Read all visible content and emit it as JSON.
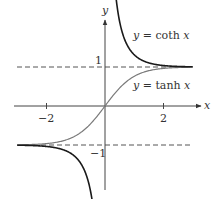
{
  "chart_data": {
    "type": "line",
    "title": "",
    "xlabel": "x",
    "ylabel": "y",
    "xlim": [
      -3.1,
      3.4
    ],
    "ylim": [
      -2.1,
      2.2
    ],
    "grid": false,
    "x_ticks": [
      {
        "value": -2,
        "label": "−2"
      },
      {
        "value": 2,
        "label": "2"
      }
    ],
    "y_ticks": [
      {
        "value": 1,
        "label": "1"
      },
      {
        "value": -1,
        "label": "−1"
      }
    ],
    "asymptotes": [
      {
        "y": 1,
        "style": "dashed"
      },
      {
        "y": -1,
        "style": "dashed"
      }
    ],
    "series": [
      {
        "name": "y = tanh x",
        "function": "tanh",
        "color": "#7a7a7a",
        "x_range": [
          -3.0,
          3.0
        ]
      },
      {
        "name": "y = coth x",
        "function": "coth",
        "color": "#1a1a1a",
        "branches": [
          [
            0.35,
            3.0
          ],
          [
            -3.0,
            -0.35
          ]
        ]
      }
    ],
    "annotations": [
      {
        "text": "y = coth x",
        "near": [
          1.1,
          1.85
        ]
      },
      {
        "text": "y = tanh x",
        "near": [
          1.1,
          0.4
        ]
      }
    ]
  },
  "labels": {
    "x_axis": "x",
    "y_axis": "y",
    "tick_x_neg2": "−2",
    "tick_x_2": "2",
    "tick_y_1": "1",
    "tick_y_neg1": "−1",
    "coth_label": "y = coth x",
    "tanh_label": "y = tanh x"
  }
}
